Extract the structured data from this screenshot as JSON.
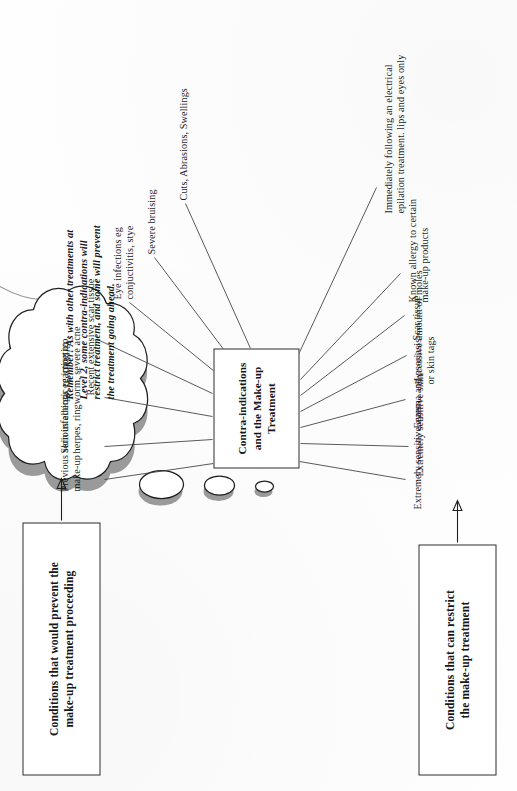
{
  "diagram": {
    "center_box": "Contra-indications\nand the Make-up\nTreatment",
    "prevent_box": "Conditions that would prevent the\nmake-up treatment proceeding",
    "restrict_box": "Conditions that can restrict\nthe make-up treatment",
    "cloud_note": "Remember! As with other treatments at\nLevel 2, some contra-indications will\nrestrict treatment, and some will prevent\nthe treatment going ahead.",
    "prevent_items": [
      "Previous serious allergic reaction to\nmake-up",
      "Skin infections eg impetigo,\nherpes, ringworm, severe acne",
      "Recent extensive scar tissue",
      "Eye infections eg\nconjuctivitis, stye",
      "Severe bruising",
      "Cuts, Abrasions, Swellings"
    ],
    "restrict_items": [
      "Extremely sensitive eyes",
      "Extremely sensitive skin",
      "Eczema and psoriasis",
      "Excessive amount of moles\nor skin tags",
      "Scar tissue",
      "Known allergy to certain\nmake-up products",
      "Immediately following an electrical\nepilation treatment. lips and eyes only"
    ]
  },
  "colors": {
    "ink": "#1f2123",
    "line": "#3a3c3f",
    "cloud_shadow": "#9a9a9a",
    "paper": "#ffffff"
  }
}
